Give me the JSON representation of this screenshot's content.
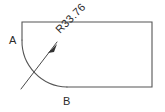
{
  "drawing": {
    "title": "Rectangle with filleted corner",
    "background_color": "#ffffff",
    "line_color": "#555555",
    "text_color": "#2b2b2b",
    "width": 165,
    "height": 112,
    "vertex_labels": {
      "a": "A",
      "b": "B"
    },
    "dimension": {
      "text": "R33.76",
      "rotation_degrees": -45,
      "type": "radius"
    },
    "geometry": {
      "rect_left": 22,
      "rect_top": 22,
      "rect_right": 152,
      "rect_bottom": 87,
      "arc_start_x": 22,
      "arc_start_y": 40,
      "arc_end_x": 67,
      "arc_end_y": 87,
      "arc_radius": 46
    }
  }
}
